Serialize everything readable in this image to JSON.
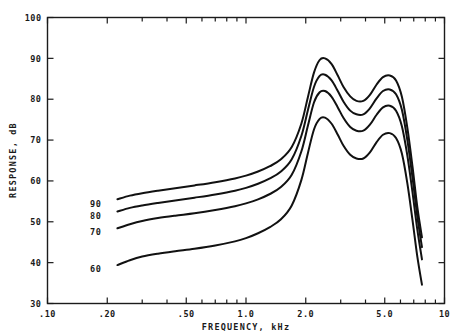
{
  "chart_data": {
    "type": "line",
    "title": "",
    "xlabel": "FREQUENCY, kHz",
    "ylabel": "RESPONSE, dB",
    "xscale": "log",
    "yscale": "linear",
    "xlim": [
      0.1,
      10
    ],
    "ylim": [
      30,
      100
    ],
    "grid": false,
    "legend_position": "inline-left",
    "x_tick_labels": [
      ".10",
      ".20",
      ".50",
      "1.0",
      "2.0",
      "5.0",
      "10"
    ],
    "x_tick_values": [
      0.1,
      0.2,
      0.5,
      1.0,
      2.0,
      5.0,
      10
    ],
    "x_minor_ticks": [
      0.3,
      0.4,
      0.6,
      0.7,
      0.8,
      0.9,
      3.0,
      4.0,
      6.0,
      7.0,
      8.0,
      9.0
    ],
    "y_tick_labels": [
      "100",
      "90",
      "80",
      "70",
      "60",
      "50",
      "40",
      "30"
    ],
    "y_tick_values": [
      100,
      90,
      80,
      70,
      60,
      50,
      40,
      30
    ],
    "series": [
      {
        "name": "90",
        "label": "90",
        "label_x": 0.175,
        "label_y": 54.5,
        "x": [
          0.225,
          0.26,
          0.3,
          0.36,
          0.44,
          0.55,
          0.7,
          0.88,
          1.0,
          1.15,
          1.32,
          1.5,
          1.7,
          1.9,
          2.05,
          2.2,
          2.35,
          2.5,
          2.7,
          2.9,
          3.1,
          3.35,
          3.6,
          3.9,
          4.2,
          4.55,
          4.9,
          5.3,
          5.7,
          6.1,
          6.5,
          6.9,
          7.3,
          7.7
        ],
        "y": [
          55.5,
          56.4,
          57.0,
          57.6,
          58.2,
          58.9,
          59.7,
          60.6,
          61.3,
          62.3,
          63.6,
          65.3,
          68.3,
          74.0,
          80.5,
          86.5,
          89.6,
          90.0,
          88.6,
          85.8,
          83.0,
          80.7,
          79.6,
          79.6,
          81.0,
          83.6,
          85.4,
          85.8,
          84.6,
          80.6,
          73.0,
          63.5,
          53.5,
          46.2
        ]
      },
      {
        "name": "80",
        "label": "80",
        "label_x": 0.175,
        "label_y": 51.5,
        "x": [
          0.225,
          0.26,
          0.3,
          0.36,
          0.44,
          0.55,
          0.7,
          0.88,
          1.0,
          1.15,
          1.32,
          1.5,
          1.7,
          1.9,
          2.05,
          2.2,
          2.35,
          2.5,
          2.7,
          2.9,
          3.1,
          3.35,
          3.6,
          3.9,
          4.2,
          4.55,
          4.9,
          5.3,
          5.7,
          6.1,
          6.5,
          6.9,
          7.3,
          7.7
        ],
        "y": [
          52.5,
          53.4,
          54.0,
          54.6,
          55.2,
          55.9,
          56.7,
          57.6,
          58.3,
          59.3,
          60.6,
          62.3,
          65.3,
          71.0,
          77.3,
          83.0,
          85.7,
          86.0,
          84.6,
          82.0,
          79.4,
          77.2,
          76.3,
          76.3,
          77.7,
          80.2,
          82.0,
          82.4,
          81.2,
          77.4,
          70.0,
          60.8,
          51.2,
          43.8
        ]
      },
      {
        "name": "70",
        "label": "70",
        "label_x": 0.175,
        "label_y": 47.5,
        "x": [
          0.225,
          0.26,
          0.3,
          0.36,
          0.44,
          0.55,
          0.7,
          0.88,
          1.0,
          1.15,
          1.32,
          1.5,
          1.7,
          1.9,
          2.05,
          2.2,
          2.35,
          2.5,
          2.7,
          2.9,
          3.1,
          3.35,
          3.6,
          3.9,
          4.2,
          4.55,
          4.9,
          5.3,
          5.7,
          6.1,
          6.5,
          6.9,
          7.3,
          7.7
        ],
        "y": [
          48.4,
          49.4,
          50.2,
          50.9,
          51.5,
          52.1,
          52.9,
          53.8,
          54.5,
          55.5,
          56.8,
          58.5,
          61.5,
          67.2,
          73.5,
          79.2,
          81.7,
          82.0,
          80.6,
          78.0,
          75.4,
          73.2,
          72.3,
          72.3,
          73.7,
          76.2,
          78.0,
          78.4,
          77.2,
          73.4,
          66.2,
          57.2,
          48.0,
          40.8
        ]
      },
      {
        "name": "60",
        "label": "60",
        "label_x": 0.175,
        "label_y": 38.5,
        "x": [
          0.225,
          0.26,
          0.3,
          0.36,
          0.44,
          0.55,
          0.7,
          0.88,
          1.0,
          1.15,
          1.32,
          1.5,
          1.7,
          1.9,
          2.05,
          2.2,
          2.35,
          2.5,
          2.7,
          2.9,
          3.1,
          3.35,
          3.6,
          3.9,
          4.2,
          4.55,
          4.9,
          5.3,
          5.7,
          6.1,
          6.5,
          6.9,
          7.3,
          7.7
        ],
        "y": [
          39.4,
          40.6,
          41.5,
          42.2,
          42.8,
          43.4,
          44.2,
          45.2,
          46.0,
          47.2,
          48.7,
          50.6,
          54.0,
          60.2,
          66.8,
          72.6,
          75.2,
          75.5,
          74.0,
          71.3,
          68.6,
          66.4,
          65.5,
          65.5,
          66.9,
          69.5,
          71.3,
          71.7,
          70.5,
          66.7,
          59.4,
          50.4,
          41.4,
          34.6
        ]
      }
    ]
  }
}
